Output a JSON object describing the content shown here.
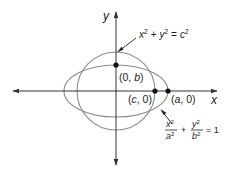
{
  "diagram": {
    "axes": {
      "x_label": "x",
      "y_label": "y"
    },
    "circle": {
      "equation_parts": {
        "x": "x",
        "y": "y",
        "c": "c",
        "exp": "2",
        "plus": "+",
        "eq": "="
      },
      "equation_text": "x² + y² = c²"
    },
    "ellipse": {
      "equation_text": "x²/a² + y²/b² = 1",
      "num_x": "x",
      "den_a": "a",
      "num_y": "y",
      "den_b": "b",
      "exp": "2",
      "plus": "+",
      "eq": "= 1"
    },
    "points": [
      {
        "label": "(0, b)",
        "open": "(0, ",
        "var": "b",
        "close": ")"
      },
      {
        "label": "(c, 0)",
        "open": "(",
        "var": "c",
        "close": ", 0)"
      },
      {
        "label": "(a, 0)",
        "open": "(",
        "var": "a",
        "close": ", 0)"
      }
    ],
    "colors": {
      "curve": "#8a8a8a",
      "axis": "#333333",
      "point": "#111111",
      "text": "#222222"
    }
  }
}
